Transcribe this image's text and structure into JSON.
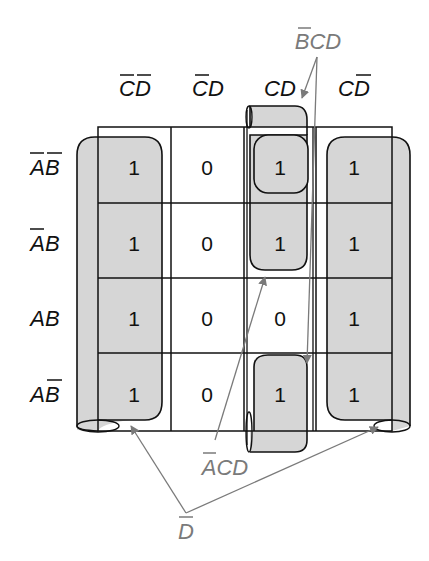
{
  "diagram": {
    "type": "karnaugh-map",
    "column_headers": [
      {
        "text": "CD",
        "overbars": [
          true,
          true
        ]
      },
      {
        "text": "CD",
        "overbars": [
          true,
          false
        ]
      },
      {
        "text": "CD",
        "overbars": [
          false,
          false
        ]
      },
      {
        "text": "CD",
        "overbars": [
          false,
          true
        ]
      }
    ],
    "row_headers": [
      {
        "text": "AB",
        "overbars": [
          true,
          true
        ]
      },
      {
        "text": "AB",
        "overbars": [
          true,
          false
        ]
      },
      {
        "text": "AB",
        "overbars": [
          false,
          false
        ]
      },
      {
        "text": "AB",
        "overbars": [
          false,
          true
        ]
      }
    ],
    "cells": [
      [
        "1",
        "0",
        "1",
        "1"
      ],
      [
        "1",
        "0",
        "1",
        "1"
      ],
      [
        "1",
        "0",
        "0",
        "1"
      ],
      [
        "1",
        "0",
        "1",
        "1"
      ]
    ],
    "groups": [
      {
        "label": "BCD",
        "overbars": [
          true,
          false,
          false
        ],
        "description": "B-bar C D wrap-around group, column CD, rows 1 and 4"
      },
      {
        "label": "ACD",
        "overbars": [
          true,
          false,
          false
        ],
        "description": "A-bar C D group, column CD, rows 1 and 2"
      },
      {
        "label": "D",
        "overbars": [
          true
        ],
        "description": "D-bar group, columns 1 and 4 wrapping around all rows"
      }
    ],
    "colors": {
      "grid_line": "#111111",
      "group_fill": "#d6d6d6",
      "annotation": "#7a7a7a"
    }
  }
}
